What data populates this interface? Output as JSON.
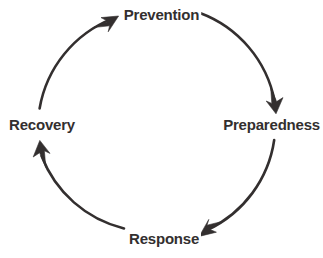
{
  "diagram": {
    "type": "cyclical-process",
    "direction": "clockwise",
    "stroke_color": "#332f2f",
    "text_color": "#332f2f",
    "background_color": "#ffffff",
    "center": {
      "x": 157,
      "y": 123
    },
    "radius": 118,
    "stages": [
      {
        "id": "prevention",
        "label": "Prevention",
        "position": "top",
        "angle_deg": 270,
        "next": "preparedness"
      },
      {
        "id": "preparedness",
        "label": "Preparedness",
        "position": "right",
        "angle_deg": 0,
        "next": "response"
      },
      {
        "id": "response",
        "label": "Response",
        "position": "bottom",
        "angle_deg": 90,
        "next": "recovery"
      },
      {
        "id": "recovery",
        "label": "Recovery",
        "position": "left",
        "angle_deg": 180,
        "next": "prevention"
      }
    ],
    "arrows": [
      {
        "id": "arrow-to-prevention",
        "points_to": "prevention",
        "tip": {
          "x": 118,
          "y": 16
        },
        "heading": "up-right"
      },
      {
        "id": "arrow-to-preparedness",
        "points_to": "preparedness",
        "tip": {
          "x": 276,
          "y": 112
        },
        "heading": "down"
      },
      {
        "id": "arrow-to-response",
        "points_to": "response",
        "tip": {
          "x": 200,
          "y": 236
        },
        "heading": "left"
      },
      {
        "id": "arrow-to-recovery",
        "points_to": "recovery",
        "tip": {
          "x": 40,
          "y": 141
        },
        "heading": "up"
      }
    ]
  }
}
